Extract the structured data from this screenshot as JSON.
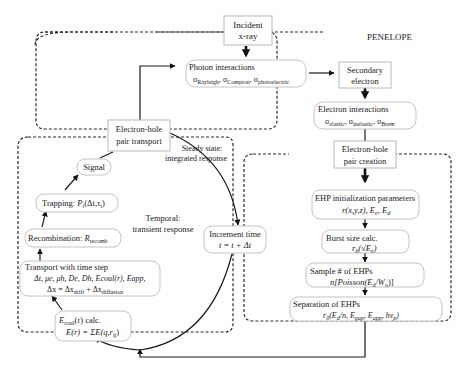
{
  "diagram": {
    "regions": {
      "penelope": {
        "label": "PENELOPE"
      },
      "steady": {
        "label_line1": "Steady state:",
        "label_line2": "integrated response"
      },
      "temporal": {
        "label_line1": "Temporal:",
        "label_line2": "transient response"
      }
    },
    "nodes": {
      "incident": {
        "line1": "Incident",
        "line2": "x-ray"
      },
      "photon": {
        "line1": "Photon interactions",
        "s1": "Rayleigh",
        "s2": "Compton",
        "s3": "photoelectric",
        "sigma": "σ"
      },
      "secondary": {
        "line1": "Secondary",
        "line2": "electron"
      },
      "electron_int": {
        "line1": "Electron interactions",
        "s1": "elastic",
        "s2": "inelastic",
        "s3": "Brem",
        "sigma": "σ"
      },
      "ehp_transport": {
        "line1": "Electron-hole",
        "line2": "pair transport"
      },
      "ehp_creation": {
        "line1": "Electron-hole",
        "line2": "pair creation"
      },
      "signal": {
        "line1": "Signal"
      },
      "trapping": {
        "prefix": "Trapping: ",
        "P": "P",
        "Psub": "t",
        "args": "(Δt,τ",
        "tsub": "t",
        "close": ")"
      },
      "recombination": {
        "prefix": "Recombination: ",
        "R": "R",
        "Rsub": "recomb"
      },
      "transport": {
        "line1": "Transport with time step",
        "line2": "Δt, μe, μh, De, Dh, Ecoul(r), Eapp,",
        "line3_a": "Δx = Δx",
        "line3_sub1": "drift",
        "line3_b": " + Δx",
        "line3_sub2": "diffusion"
      },
      "ecoul": {
        "E": "E",
        "Esub": "coul",
        "rest1": "(r) calc.",
        "line2_a": "E(r) = ΣE(q,r",
        "line2_sub": "ij",
        "line2_b": ")"
      },
      "increment": {
        "line1": "Increment time",
        "line2": "t = t + Δt"
      },
      "ehp_init": {
        "line1": "EHP initialization parameters",
        "line2_a": "r(x,y,z), E",
        "sub_e": "e",
        "line2_b": ", E",
        "sub_d": "d"
      },
      "burst": {
        "line1": "Burst size calc.",
        "r": "r",
        "rsub": "b",
        "arg": "(√E",
        "esub": "e",
        "close": ")"
      },
      "sample": {
        "line1": "Sample # of EHPs",
        "line2_a": "n[Poisson(E",
        "sub_d": "d",
        "mid": "/W",
        "sub_o": "o",
        "close": ")]"
      },
      "separation": {
        "line1": "Separation of EHPs",
        "r": "r",
        "rsub": "0",
        "a": "(E",
        "sub_d": "d",
        "b": "/n, E",
        "sub_gap": "gap",
        "c": ", E",
        "sub_app": "app",
        "d": ", hν",
        "sub_p": "p",
        "e": ")"
      }
    }
  }
}
